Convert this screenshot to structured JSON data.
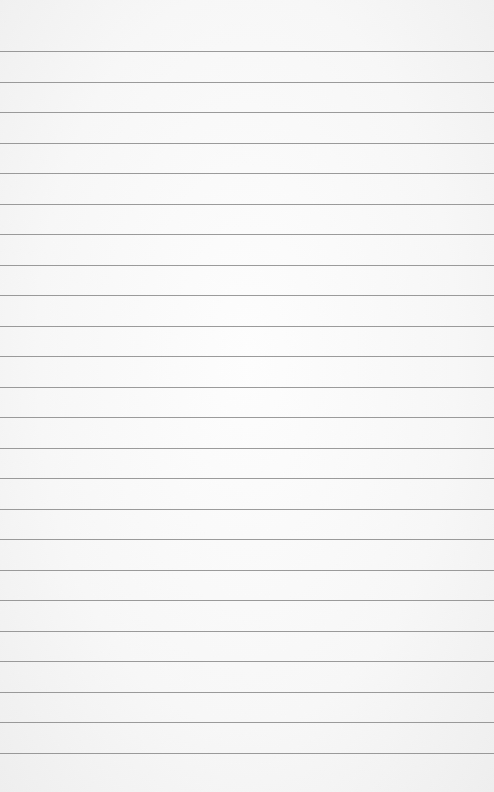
{
  "paper": {
    "type": "lined-paper",
    "background_color": "#f6f6f6",
    "rule_color": "#8a8a8a",
    "first_rule_y": 51,
    "rule_spacing": 30.5,
    "rule_count": 24
  }
}
